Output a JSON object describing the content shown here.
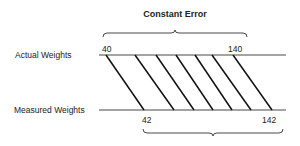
{
  "title": "Constant Error",
  "rows": {
    "actual": {
      "label": "Actual Weights",
      "start_value": "40",
      "end_value": "140"
    },
    "measured": {
      "label": "Measured Weights",
      "start_value": "42",
      "end_value": "142"
    }
  },
  "mapping_lines": [
    {
      "from_x": 106,
      "to_x": 144
    },
    {
      "from_x": 135,
      "to_x": 174
    },
    {
      "from_x": 156,
      "to_x": 194
    },
    {
      "from_x": 176,
      "to_x": 213
    },
    {
      "from_x": 195,
      "to_x": 232
    },
    {
      "from_x": 212,
      "to_x": 251
    },
    {
      "from_x": 233,
      "to_x": 272
    }
  ],
  "colors": {
    "ink": "#1a1a1a",
    "background": "#ffffff"
  }
}
